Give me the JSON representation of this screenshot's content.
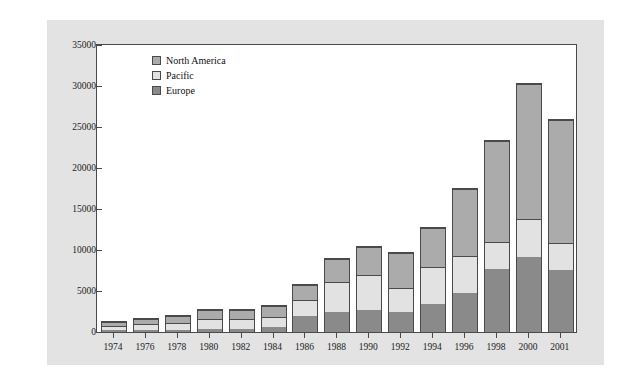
{
  "chart_data": {
    "type": "bar",
    "subtype": "stacked-vertical",
    "title": "",
    "xlabel": "",
    "ylabel": "Billions of U.S. dollars",
    "ylim": [
      0,
      35000
    ],
    "yticks": [
      0,
      5000,
      10000,
      15000,
      20000,
      25000,
      30000,
      35000
    ],
    "ytick_labels": [
      "0",
      "5000",
      "10000",
      "15000",
      "20000",
      "25000",
      "30000",
      "35000"
    ],
    "grid": false,
    "legend_position": "top-left-inside",
    "stack_order_bottom_to_top": [
      "Europe",
      "Pacific",
      "North America"
    ],
    "categories": [
      "1974",
      "1976",
      "1978",
      "1980",
      "1982",
      "1984",
      "1986",
      "1988",
      "1990",
      "1992",
      "1994",
      "1996",
      "1998",
      "2000",
      "2001"
    ],
    "series": [
      {
        "name": "Europe",
        "color": "#8a8a8a",
        "values": [
          200,
          250,
          300,
          400,
          400,
          600,
          1900,
          2500,
          2700,
          2500,
          3400,
          4800,
          7700,
          9200,
          7600
        ]
      },
      {
        "name": "Pacific",
        "color": "#e2e2e2",
        "values": [
          400,
          600,
          700,
          1100,
          1100,
          1100,
          1900,
          3500,
          4100,
          2700,
          4400,
          4300,
          3100,
          4500,
          3100
        ]
      },
      {
        "name": "North America",
        "color": "#ababab",
        "values": [
          400,
          550,
          700,
          900,
          900,
          1200,
          1700,
          2700,
          3300,
          4200,
          4700,
          8100,
          12200,
          16300,
          14900
        ]
      }
    ],
    "totals": [
      1000,
      1400,
      1700,
      2400,
      2400,
      2900,
      5500,
      8700,
      10100,
      9400,
      12500,
      17200,
      23000,
      30000,
      25600
    ]
  },
  "legend": {
    "items": [
      {
        "label": "North America",
        "key": "northamerica"
      },
      {
        "label": "Pacific",
        "key": "pacific"
      },
      {
        "label": "Europe",
        "key": "europe"
      }
    ]
  },
  "colors": {
    "page_background": "#ffffff",
    "figure_background": "#e3e3e3",
    "plot_background": "#ffffff",
    "axis_line": "#4a4a4a",
    "text": "#111111",
    "north_america": "#ababab",
    "pacific": "#e2e2e2",
    "europe": "#8a8a8a"
  }
}
